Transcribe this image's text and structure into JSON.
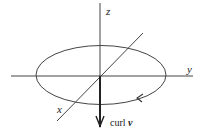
{
  "diagram": {
    "type": "3d-axes-with-circulation-loop",
    "axes": {
      "z": {
        "label": "z"
      },
      "y": {
        "label": "y"
      },
      "x": {
        "label": "x"
      }
    },
    "loop": {
      "shape": "ellipse",
      "orientation": "clockwise-arrow"
    },
    "vector": {
      "label_prefix": "curl",
      "label_var": "v",
      "direction": "down"
    },
    "colors": {
      "line": "#333333",
      "background": "#ffffff"
    }
  }
}
